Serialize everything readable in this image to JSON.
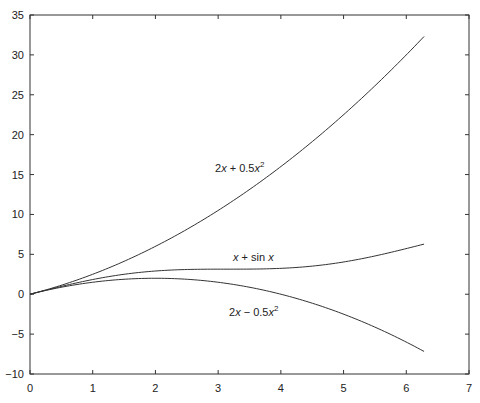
{
  "chart_data": {
    "type": "line",
    "title": "",
    "xlabel": "",
    "ylabel": "",
    "xlim": [
      0,
      7
    ],
    "ylim": [
      -10,
      35
    ],
    "grid": false,
    "legend": "none",
    "x_ticks": [
      "0",
      "1",
      "2",
      "3",
      "4",
      "5",
      "6",
      "7"
    ],
    "y_ticks": [
      "-10",
      "-5",
      "0",
      "5",
      "10",
      "15",
      "20",
      "25",
      "30",
      "35"
    ],
    "x": [
      0,
      0.5,
      1,
      1.5,
      2,
      2.5,
      3,
      3.5,
      4,
      4.5,
      5,
      5.5,
      6,
      6.2832
    ],
    "series": [
      {
        "name": "2x + 0.5x^2",
        "values": [
          0,
          1.13,
          2.5,
          4.13,
          6.0,
          8.13,
          10.5,
          13.13,
          16.0,
          19.13,
          22.5,
          26.13,
          30.0,
          32.3
        ]
      },
      {
        "name": "x + sin x",
        "values": [
          0,
          0.98,
          1.84,
          2.5,
          2.91,
          3.1,
          3.14,
          3.15,
          3.24,
          3.52,
          4.04,
          4.79,
          5.72,
          6.28
        ]
      },
      {
        "name": "2x - 0.5x^2",
        "values": [
          0,
          0.88,
          1.5,
          1.88,
          2.0,
          1.88,
          1.5,
          0.88,
          0,
          -1.13,
          -2.5,
          -4.13,
          -6.0,
          -7.17
        ]
      }
    ],
    "annotations": [
      {
        "text": "2x + 0.5x²",
        "x": 3.2,
        "y": 15.5
      },
      {
        "text": "x + sin x",
        "x": 3.6,
        "y": 5.2
      },
      {
        "text": "2x − 0.5x²",
        "x": 3.6,
        "y": -2.5
      }
    ]
  },
  "labels": {
    "anno_top_a": "2",
    "anno_top_b": "x",
    "anno_top_c": " + 0.5",
    "anno_top_d": "x",
    "anno_top_e": "2",
    "anno_mid_a": "x",
    "anno_mid_b": " + sin ",
    "anno_mid_c": "x",
    "anno_bot_a": "2",
    "anno_bot_b": "x",
    "anno_bot_c": " − 0.5",
    "anno_bot_d": "x",
    "anno_bot_e": "2"
  }
}
